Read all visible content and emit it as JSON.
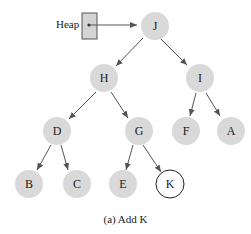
{
  "pointer": {
    "label": "Heap"
  },
  "nodes": {
    "J": "J",
    "H": "H",
    "I": "I",
    "D": "D",
    "G": "G",
    "F": "F",
    "A": "A",
    "B": "B",
    "C": "C",
    "E": "E",
    "K": "K"
  },
  "caption": "(a) Add K",
  "colors": {
    "node_fill": "#d9d9d9",
    "new_node_fill": "#ffffff",
    "edge": "#555555",
    "pointer_box": "#d4d4d4"
  }
}
